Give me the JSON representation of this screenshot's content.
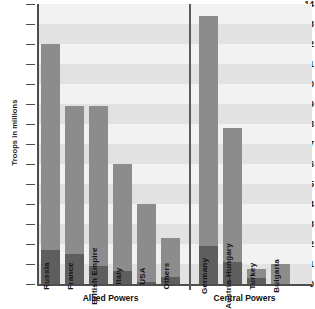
{
  "chart_data": {
    "type": "bar",
    "title": "",
    "xlabel": "",
    "ylabel": "Troops in millions",
    "ylim": [
      0,
      14
    ],
    "ytick_labels": [
      "14",
      "13",
      "12",
      "11",
      "10",
      "9",
      "8",
      "7",
      "6",
      "5",
      "4",
      "3",
      "2",
      "1",
      "0"
    ],
    "grid": true,
    "legend_position": "none",
    "groups": [
      {
        "name": "Allied Powers",
        "bars": [
          {
            "label": "Russia",
            "total": 12.0,
            "base": 1.7
          },
          {
            "label": "France",
            "total": 8.9,
            "base": 1.5
          },
          {
            "label": "British Empire",
            "total": 8.9,
            "base": 0.9
          },
          {
            "label": "Italy",
            "total": 6.0,
            "base": 0.65
          },
          {
            "label": "USA",
            "total": 4.0,
            "base": 0.12
          },
          {
            "label": "Others",
            "total": 2.3,
            "base": 0.35
          }
        ]
      },
      {
        "name": "Central Powers",
        "bars": [
          {
            "label": "Germany",
            "total": 13.4,
            "base": 1.9
          },
          {
            "label": "Austria-Hungary",
            "total": 7.8,
            "base": 1.1
          },
          {
            "label": "Turkey",
            "total": 0.75,
            "base": 0.3
          },
          {
            "label": "Bulgaria",
            "total": 1.0,
            "base": 0.0
          }
        ]
      }
    ],
    "series": [
      {
        "name": "Total mobilized",
        "values": [
          12.0,
          8.9,
          8.9,
          6.0,
          4.0,
          2.3,
          13.4,
          7.8,
          0.75,
          1.0
        ]
      },
      {
        "name": "Killed",
        "values": [
          1.7,
          1.5,
          0.9,
          0.65,
          0.12,
          0.35,
          1.9,
          1.1,
          0.3,
          0.0
        ]
      }
    ],
    "categories": [
      "Russia",
      "France",
      "British Empire",
      "Italy",
      "USA",
      "Others",
      "Germany",
      "Austria-Hungary",
      "Turkey",
      "Bulgaria"
    ]
  },
  "colors": {
    "bar_light": "#8c8c8c",
    "bar_dark": "#5e5e5e",
    "band": "#e2e2e2",
    "band_alt": "#f2f2f2",
    "axis": "#4d4d4d",
    "text": "#111111",
    "background": "#ffffff"
  }
}
